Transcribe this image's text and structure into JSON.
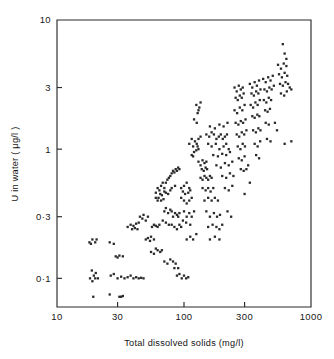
{
  "figure": {
    "width": 334,
    "height": 359,
    "background": "#ffffff",
    "ink_color": "#2a2a2a"
  },
  "plot_frame": {
    "left": 57,
    "right": 311,
    "top": 20,
    "bottom": 307
  },
  "chart_data": {
    "type": "scatter",
    "title": "",
    "xlabel": "Total dissolved solids (mg/l)",
    "ylabel": "U in water ( μg/l )",
    "xscale": "log",
    "yscale": "log",
    "xlim": [
      10,
      1000
    ],
    "ylim": [
      0.06,
      10
    ],
    "grid": false,
    "legend": null,
    "xticks": [
      10,
      30,
      100,
      300,
      1000
    ],
    "xticklabels": [
      "10",
      "30",
      "100",
      "300",
      "1000"
    ],
    "yticks": [
      0.1,
      0.3,
      1,
      3,
      10
    ],
    "yticklabels": [
      "0·1",
      "0·3",
      "1",
      "3",
      "10"
    ],
    "marker": "dot",
    "marker_size": 1.6,
    "n_points": 296,
    "points": [
      [
        18,
        0.19
      ],
      [
        19,
        0.2
      ],
      [
        20,
        0.19
      ],
      [
        18.5,
        0.185
      ],
      [
        20.5,
        0.2
      ],
      [
        19.5,
        0.105
      ],
      [
        18.2,
        0.1
      ],
      [
        20.2,
        0.11
      ],
      [
        19,
        0.095
      ],
      [
        21,
        0.1
      ],
      [
        18.8,
        0.115
      ],
      [
        20,
        0.1
      ],
      [
        19.3,
        0.072
      ],
      [
        26,
        0.075
      ],
      [
        31,
        0.072
      ],
      [
        33,
        0.073
      ],
      [
        32,
        0.072
      ],
      [
        26,
        0.19
      ],
      [
        28,
        0.185
      ],
      [
        30,
        0.145
      ],
      [
        31,
        0.15
      ],
      [
        29,
        0.148
      ],
      [
        26.5,
        0.105
      ],
      [
        28,
        0.108
      ],
      [
        30,
        0.1
      ],
      [
        32,
        0.103
      ],
      [
        34,
        0.1
      ],
      [
        36,
        0.102
      ],
      [
        38,
        0.105
      ],
      [
        40,
        0.1
      ],
      [
        42,
        0.102
      ],
      [
        44,
        0.1
      ],
      [
        46,
        0.101
      ],
      [
        48,
        0.1
      ],
      [
        33,
        0.148
      ],
      [
        36,
        0.25
      ],
      [
        38,
        0.26
      ],
      [
        40,
        0.255
      ],
      [
        42,
        0.265
      ],
      [
        44,
        0.27
      ],
      [
        39,
        0.24
      ],
      [
        41,
        0.245
      ],
      [
        43,
        0.24
      ],
      [
        45,
        0.3
      ],
      [
        47,
        0.29
      ],
      [
        50,
        0.28
      ],
      [
        52,
        0.3
      ],
      [
        48,
        0.31
      ],
      [
        50,
        0.2
      ],
      [
        52,
        0.205
      ],
      [
        55,
        0.21
      ],
      [
        58,
        0.2
      ],
      [
        54,
        0.195
      ],
      [
        56,
        0.25
      ],
      [
        58,
        0.26
      ],
      [
        60,
        0.255
      ],
      [
        62,
        0.25
      ],
      [
        64,
        0.26
      ],
      [
        55,
        0.16
      ],
      [
        58,
        0.155
      ],
      [
        60,
        0.17
      ],
      [
        62,
        0.165
      ],
      [
        65,
        0.16
      ],
      [
        67,
        0.165
      ],
      [
        60,
        0.46
      ],
      [
        62,
        0.5
      ],
      [
        64,
        0.48
      ],
      [
        66,
        0.52
      ],
      [
        68,
        0.55
      ],
      [
        70,
        0.5
      ],
      [
        72,
        0.55
      ],
      [
        74,
        0.58
      ],
      [
        76,
        0.6
      ],
      [
        78,
        0.62
      ],
      [
        80,
        0.65
      ],
      [
        82,
        0.68
      ],
      [
        84,
        0.66
      ],
      [
        86,
        0.7
      ],
      [
        88,
        0.68
      ],
      [
        90,
        0.72
      ],
      [
        92,
        0.7
      ],
      [
        65,
        0.45
      ],
      [
        67,
        0.44
      ],
      [
        70,
        0.47
      ],
      [
        72,
        0.46
      ],
      [
        75,
        0.45
      ],
      [
        78,
        0.48
      ],
      [
        80,
        0.5
      ],
      [
        85,
        0.52
      ],
      [
        63,
        0.42
      ],
      [
        66,
        0.4
      ],
      [
        69,
        0.41
      ],
      [
        62,
        0.4
      ],
      [
        60,
        0.42
      ],
      [
        70,
        0.33
      ],
      [
        72,
        0.35
      ],
      [
        75,
        0.32
      ],
      [
        78,
        0.34
      ],
      [
        80,
        0.33
      ],
      [
        82,
        0.3
      ],
      [
        85,
        0.32
      ],
      [
        88,
        0.31
      ],
      [
        90,
        0.3
      ],
      [
        92,
        0.32
      ],
      [
        68,
        0.28
      ],
      [
        72,
        0.27
      ],
      [
        76,
        0.26
      ],
      [
        80,
        0.26
      ],
      [
        84,
        0.25
      ],
      [
        88,
        0.24
      ],
      [
        92,
        0.26
      ],
      [
        95,
        0.25
      ],
      [
        70,
        0.135
      ],
      [
        74,
        0.13
      ],
      [
        78,
        0.14
      ],
      [
        82,
        0.135
      ],
      [
        86,
        0.13
      ],
      [
        88,
        0.105
      ],
      [
        92,
        0.108
      ],
      [
        96,
        0.1
      ],
      [
        100,
        0.105
      ],
      [
        104,
        0.1
      ],
      [
        108,
        0.102
      ],
      [
        90,
        0.12
      ],
      [
        84,
        0.12
      ],
      [
        95,
        0.5
      ],
      [
        100,
        0.52
      ],
      [
        105,
        0.55
      ],
      [
        110,
        0.5
      ],
      [
        98,
        0.47
      ],
      [
        102,
        0.45
      ],
      [
        108,
        0.46
      ],
      [
        112,
        0.48
      ],
      [
        95,
        0.42
      ],
      [
        100,
        0.4
      ],
      [
        105,
        0.38
      ],
      [
        110,
        0.4
      ],
      [
        115,
        0.42
      ],
      [
        100,
        0.33
      ],
      [
        105,
        0.3
      ],
      [
        110,
        0.32
      ],
      [
        115,
        0.3
      ],
      [
        120,
        0.33
      ],
      [
        98,
        0.28
      ],
      [
        104,
        0.27
      ],
      [
        112,
        0.26
      ],
      [
        105,
        0.2
      ],
      [
        112,
        0.21
      ],
      [
        118,
        0.2
      ],
      [
        125,
        0.22
      ],
      [
        110,
        1.1
      ],
      [
        115,
        1.2
      ],
      [
        118,
        1.05
      ],
      [
        122,
        1.15
      ],
      [
        126,
        1.1
      ],
      [
        130,
        1.2
      ],
      [
        135,
        1.25
      ],
      [
        120,
        0.95
      ],
      [
        125,
        0.98
      ],
      [
        130,
        1.0
      ],
      [
        115,
        0.9
      ],
      [
        118,
        0.88
      ],
      [
        128,
        1.05
      ],
      [
        125,
        2.2
      ],
      [
        130,
        2.0
      ],
      [
        135,
        2.3
      ],
      [
        128,
        1.9
      ],
      [
        132,
        2.1
      ],
      [
        120,
        1.7
      ],
      [
        126,
        1.6
      ],
      [
        130,
        0.8
      ],
      [
        135,
        0.75
      ],
      [
        140,
        0.82
      ],
      [
        145,
        0.78
      ],
      [
        150,
        0.8
      ],
      [
        138,
        0.7
      ],
      [
        143,
        0.68
      ],
      [
        148,
        0.72
      ],
      [
        152,
        0.7
      ],
      [
        135,
        0.6
      ],
      [
        140,
        0.58
      ],
      [
        145,
        0.62
      ],
      [
        150,
        0.6
      ],
      [
        155,
        0.58
      ],
      [
        160,
        0.62
      ],
      [
        165,
        0.6
      ],
      [
        140,
        0.5
      ],
      [
        148,
        0.48
      ],
      [
        155,
        0.5
      ],
      [
        162,
        0.47
      ],
      [
        170,
        0.5
      ],
      [
        145,
        0.4
      ],
      [
        155,
        0.42
      ],
      [
        165,
        0.4
      ],
      [
        175,
        0.42
      ],
      [
        185,
        0.4
      ],
      [
        150,
        0.33
      ],
      [
        160,
        0.3
      ],
      [
        172,
        0.32
      ],
      [
        182,
        0.3
      ],
      [
        192,
        0.31
      ],
      [
        155,
        0.25
      ],
      [
        168,
        0.26
      ],
      [
        180,
        0.25
      ],
      [
        190,
        0.24
      ],
      [
        200,
        0.26
      ],
      [
        160,
        0.2
      ],
      [
        175,
        0.21
      ],
      [
        190,
        0.2
      ],
      [
        150,
        1.3
      ],
      [
        158,
        1.25
      ],
      [
        165,
        1.35
      ],
      [
        172,
        1.3
      ],
      [
        180,
        1.2
      ],
      [
        188,
        1.25
      ],
      [
        195,
        1.3
      ],
      [
        202,
        1.2
      ],
      [
        210,
        1.25
      ],
      [
        218,
        1.3
      ],
      [
        155,
        1.1
      ],
      [
        165,
        1.05
      ],
      [
        178,
        1.1
      ],
      [
        190,
        1.0
      ],
      [
        205,
        1.05
      ],
      [
        215,
        1.1
      ],
      [
        225,
        1.0
      ],
      [
        160,
        1.5
      ],
      [
        175,
        1.45
      ],
      [
        190,
        1.55
      ],
      [
        205,
        1.5
      ],
      [
        220,
        1.6
      ],
      [
        170,
        0.9
      ],
      [
        185,
        0.88
      ],
      [
        200,
        0.92
      ],
      [
        215,
        0.9
      ],
      [
        230,
        0.95
      ],
      [
        180,
        0.75
      ],
      [
        195,
        0.72
      ],
      [
        210,
        0.78
      ],
      [
        225,
        0.75
      ],
      [
        240,
        0.8
      ],
      [
        200,
        0.62
      ],
      [
        215,
        0.6
      ],
      [
        230,
        0.65
      ],
      [
        245,
        0.62
      ],
      [
        210,
        0.5
      ],
      [
        225,
        0.48
      ],
      [
        240,
        0.52
      ],
      [
        220,
        0.33
      ],
      [
        235,
        0.3
      ],
      [
        250,
        3.0
      ],
      [
        260,
        2.8
      ],
      [
        270,
        3.1
      ],
      [
        280,
        2.9
      ],
      [
        290,
        3.0
      ],
      [
        255,
        2.5
      ],
      [
        265,
        2.4
      ],
      [
        275,
        2.6
      ],
      [
        285,
        2.5
      ],
      [
        295,
        2.7
      ],
      [
        250,
        2.0
      ],
      [
        262,
        1.9
      ],
      [
        275,
        2.1
      ],
      [
        288,
        2.0
      ],
      [
        300,
        2.2
      ],
      [
        255,
        1.6
      ],
      [
        268,
        1.55
      ],
      [
        280,
        1.65
      ],
      [
        292,
        1.6
      ],
      [
        305,
        1.7
      ],
      [
        260,
        1.3
      ],
      [
        272,
        1.25
      ],
      [
        285,
        1.35
      ],
      [
        298,
        1.3
      ],
      [
        310,
        1.4
      ],
      [
        265,
        1.05
      ],
      [
        278,
        1.0
      ],
      [
        290,
        1.1
      ],
      [
        302,
        1.05
      ],
      [
        270,
        0.85
      ],
      [
        285,
        0.82
      ],
      [
        300,
        0.88
      ],
      [
        280,
        0.7
      ],
      [
        295,
        0.68
      ],
      [
        310,
        0.7
      ],
      [
        320,
        0.75
      ],
      [
        330,
        3.2
      ],
      [
        345,
        3.0
      ],
      [
        360,
        3.3
      ],
      [
        375,
        3.1
      ],
      [
        390,
        3.4
      ],
      [
        340,
        2.7
      ],
      [
        355,
        2.6
      ],
      [
        370,
        2.8
      ],
      [
        385,
        2.7
      ],
      [
        400,
        2.9
      ],
      [
        335,
        2.2
      ],
      [
        350,
        2.1
      ],
      [
        365,
        2.3
      ],
      [
        380,
        2.2
      ],
      [
        395,
        2.4
      ],
      [
        345,
        1.8
      ],
      [
        360,
        1.75
      ],
      [
        378,
        1.85
      ],
      [
        392,
        1.8
      ],
      [
        350,
        1.4
      ],
      [
        368,
        1.35
      ],
      [
        385,
        1.45
      ],
      [
        400,
        1.4
      ],
      [
        360,
        1.1
      ],
      [
        380,
        1.05
      ],
      [
        398,
        1.15
      ],
      [
        370,
        0.9
      ],
      [
        390,
        0.85
      ],
      [
        420,
        3.5
      ],
      [
        440,
        3.3
      ],
      [
        460,
        3.6
      ],
      [
        480,
        3.4
      ],
      [
        500,
        3.7
      ],
      [
        430,
        2.9
      ],
      [
        450,
        2.8
      ],
      [
        470,
        3.0
      ],
      [
        490,
        2.9
      ],
      [
        510,
        3.1
      ],
      [
        425,
        2.4
      ],
      [
        445,
        2.3
      ],
      [
        465,
        2.5
      ],
      [
        485,
        2.4
      ],
      [
        435,
        2.0
      ],
      [
        455,
        1.95
      ],
      [
        475,
        2.05
      ],
      [
        440,
        1.6
      ],
      [
        465,
        1.55
      ],
      [
        450,
        1.2
      ],
      [
        480,
        1.15
      ],
      [
        550,
        4.5
      ],
      [
        580,
        4.2
      ],
      [
        610,
        4.6
      ],
      [
        640,
        4.4
      ],
      [
        560,
        3.8
      ],
      [
        590,
        3.6
      ],
      [
        620,
        3.9
      ],
      [
        650,
        3.7
      ],
      [
        570,
        3.2
      ],
      [
        600,
        3.1
      ],
      [
        630,
        3.3
      ],
      [
        660,
        3.2
      ],
      [
        580,
        2.7
      ],
      [
        615,
        2.6
      ],
      [
        645,
        2.8
      ],
      [
        600,
        6.5
      ],
      [
        620,
        5.5
      ],
      [
        640,
        5.0
      ],
      [
        680,
        3.0
      ],
      [
        700,
        2.9
      ],
      [
        620,
        1.1
      ],
      [
        700,
        1.15
      ],
      [
        520,
        1.6
      ],
      [
        540,
        1.4
      ],
      [
        330,
        0.55
      ],
      [
        300,
        0.45
      ]
    ]
  }
}
